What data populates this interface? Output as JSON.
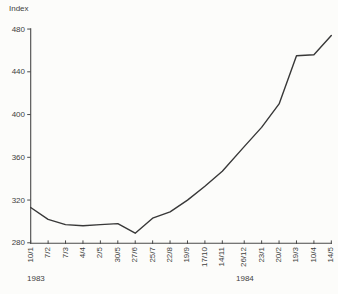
{
  "title": "Index",
  "year_labels": {
    "left": "1983",
    "right": "1984"
  },
  "colors": {
    "ink": "#3f3f3f",
    "curve": "#383838",
    "axis": "#4a4a4a",
    "background": "#fcfcfa"
  },
  "chart_data": {
    "type": "line",
    "title": "Index",
    "ylabel": "Index",
    "xlabel": "",
    "grid": false,
    "legend": null,
    "ylim": [
      280,
      480
    ],
    "y_ticks": [
      280,
      320,
      360,
      400,
      440,
      480
    ],
    "x_tick_labels": [
      "10/1",
      "7/2",
      "7/3",
      "4/4",
      "2/5",
      "30/5",
      "27/6",
      "25/7",
      "22/8",
      "19/9",
      "17/10",
      "14/11",
      "26/12",
      "23/1",
      "20/2",
      "19/3",
      "10/4",
      "14/5"
    ],
    "x_year_of_tick": [
      "1983",
      "1983",
      "1983",
      "1983",
      "1983",
      "1983",
      "1983",
      "1983",
      "1983",
      "1983",
      "1983",
      "1983",
      "1983",
      "1984",
      "1984",
      "1984",
      "1984",
      "1984"
    ],
    "values": [
      313,
      302,
      297,
      296,
      297,
      298,
      289,
      303,
      309,
      320,
      333,
      347,
      370,
      388,
      410,
      455,
      456,
      474
    ]
  }
}
